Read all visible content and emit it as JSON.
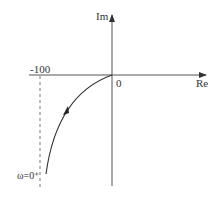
{
  "diagram": {
    "type": "nyquist-plot",
    "axes": {
      "real_label": "Re",
      "imag_label": "Im",
      "origin_label": "0"
    },
    "asymptote": {
      "label": "-100",
      "style": "dashed"
    },
    "curve": {
      "start_label": "ω=0⁺",
      "direction": "toward origin"
    },
    "colors": {
      "line": "#444444",
      "text": "#333333"
    }
  }
}
